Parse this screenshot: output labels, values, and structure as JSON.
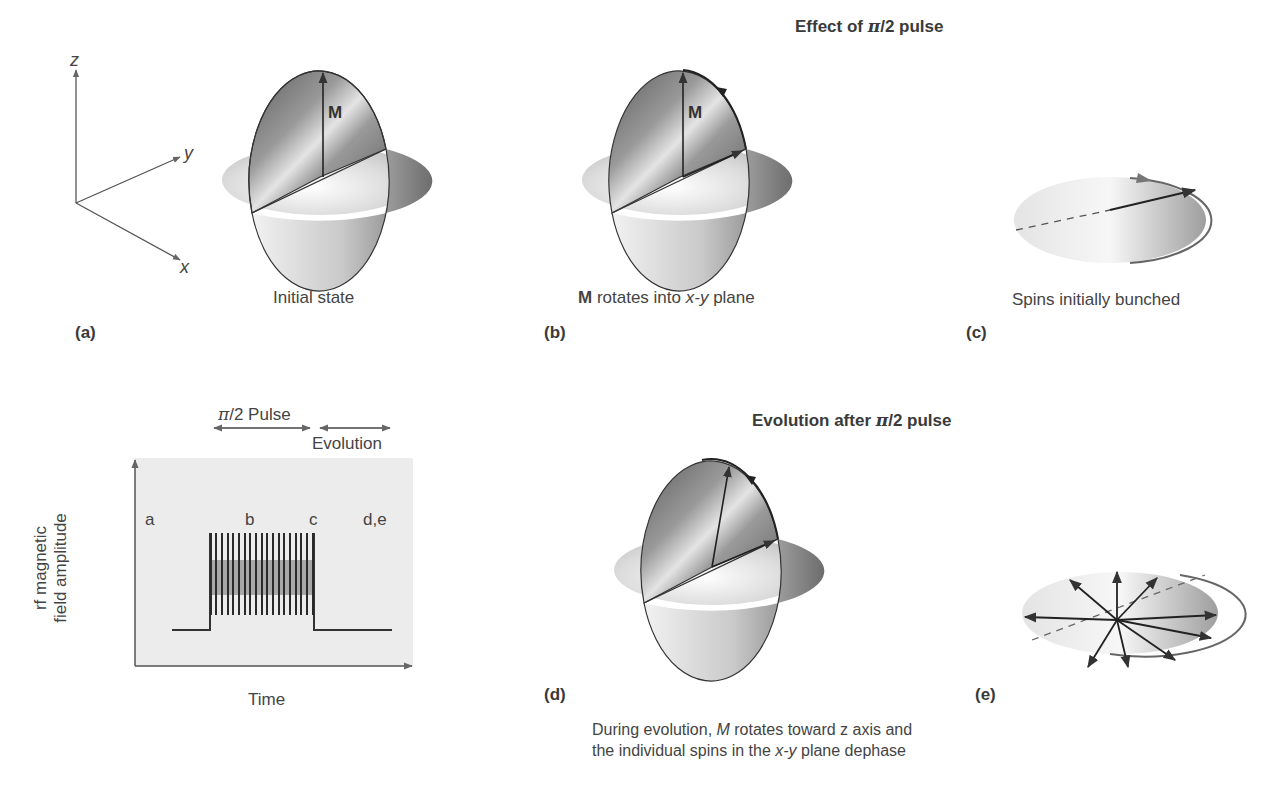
{
  "headings": {
    "top": {
      "prefix": "Effect of ",
      "pi": "π",
      "suffix": "/2 pulse"
    },
    "bottom": {
      "prefix": "Evolution after ",
      "pi": "π",
      "suffix": "/2 pulse"
    }
  },
  "axes": {
    "z": "z",
    "y": "y",
    "x": "x"
  },
  "panels": {
    "a": {
      "label": "(a)",
      "caption": "Initial state",
      "vector_label": "M"
    },
    "b": {
      "label": "(b)",
      "caption_bold": "M",
      "caption_mid": " rotates into ",
      "caption_ital": "x-y",
      "caption_end": " plane",
      "vector_label": "M"
    },
    "c": {
      "label": "(c)",
      "caption": "Spins initially bunched"
    },
    "d": {
      "label": "(d)"
    },
    "e": {
      "label": "(e)",
      "caption_line1_pre": "During evolution, ",
      "caption_line1_ital": "M",
      "caption_line1_post": " rotates toward z axis and",
      "caption_line2_pre": "the individual spins in the ",
      "caption_line2_ital": "x-y",
      "caption_line2_post": " plane dephase"
    }
  },
  "pulse_plot": {
    "pulse_label_pi": "π",
    "pulse_label_rest": "/2 Pulse",
    "evolution_label": "Evolution",
    "ylabel_line1": "rf magnetic",
    "ylabel_line2": "field amplitude",
    "xlabel": "Time",
    "stage_labels": [
      "a",
      "b",
      "c",
      "d,e"
    ]
  },
  "colors": {
    "ink": "#3a3a3a",
    "plot_bg": "#ececec",
    "sphere_dark": "#6e6e6e",
    "sphere_light": "#e8e8e8"
  }
}
